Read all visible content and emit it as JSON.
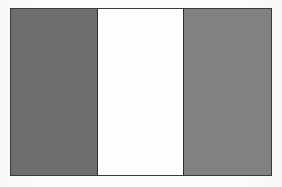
{
  "image": {
    "subject": "vertical-tricolour-flag",
    "orientation": "vertical-bands",
    "band_count": "3",
    "rendering": "grayscale",
    "background_color": "#fbfbfa",
    "border_color": "#3a3a3a"
  },
  "flag": {
    "bands": [
      {
        "name": "hoist-band",
        "position": "left",
        "color": "#6e6e6e",
        "width_share": "33%"
      },
      {
        "name": "middle-band",
        "position": "center",
        "color": "#fdfdfd",
        "width_share": "33%"
      },
      {
        "name": "fly-band",
        "position": "right",
        "color": "#828282",
        "width_share": "34%"
      }
    ]
  }
}
